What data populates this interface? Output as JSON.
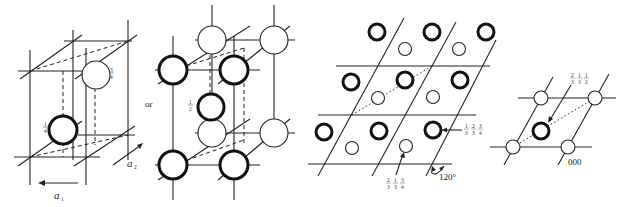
{
  "figure": {
    "panels": [
      {
        "id": "a",
        "description": "hexagonal unit cell with two atoms",
        "labels": {
          "upper_atom_height": "3/4",
          "lower_atom_height": "1/4",
          "axis_a1": "a1",
          "axis_a2": "a2"
        }
      },
      {
        "id": "b",
        "description": "alternate hcp cell choice",
        "labels": {
          "connector": "or",
          "middle_atom_height": "1/2"
        }
      },
      {
        "id": "c",
        "description": "plan view of hcp layers",
        "labels": {
          "thick_atom_coords": [
            "1/3",
            "2/3",
            "1/4"
          ],
          "thin_atom_coords": [
            "2/3",
            "1/3",
            "3/4"
          ],
          "angle": "120°"
        }
      },
      {
        "id": "d",
        "description": "single cell plan view",
        "labels": {
          "inner_atom_coords": [
            "2/3",
            "1/3",
            "1/2"
          ],
          "origin": "000"
        }
      }
    ]
  }
}
